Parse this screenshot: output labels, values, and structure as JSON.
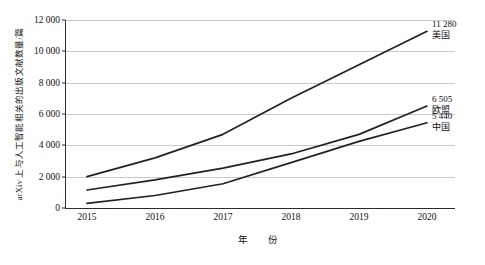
{
  "chart_data": {
    "type": "line",
    "title": "",
    "xlabel": "年　份",
    "ylabel": "arXiv 上与人工智能相关的出版文献数量/篇",
    "categories": [
      "2015",
      "2016",
      "2017",
      "2018",
      "2019",
      "2020"
    ],
    "x": [
      2015,
      2016,
      2017,
      2018,
      2019,
      2020
    ],
    "xlim": [
      2015,
      2020
    ],
    "ylim": [
      0,
      12000
    ],
    "yticks": [
      0,
      2000,
      4000,
      6000,
      8000,
      10000,
      12000
    ],
    "ytick_labels": [
      "0",
      "2 000",
      "4 000",
      "6 000",
      "8 000",
      "10 000",
      "12 000"
    ],
    "grid": true,
    "legend_position": "inline-end-labels",
    "series": [
      {
        "name": "美国",
        "values": [
          2000,
          3200,
          4700,
          7000,
          9150,
          11280
        ],
        "end_value_label": "11 280",
        "color": "#222222"
      },
      {
        "name": "欧盟",
        "values": [
          1150,
          1800,
          2550,
          3450,
          4700,
          6505
        ],
        "end_value_label": "6 505",
        "color": "#222222"
      },
      {
        "name": "中国",
        "values": [
          300,
          800,
          1550,
          2900,
          4250,
          5440
        ],
        "end_value_label": "5 440",
        "color": "#222222"
      }
    ],
    "annotations": [
      {
        "value": "11 280",
        "name": "美国"
      },
      {
        "value": "6 505",
        "name": "欧盟"
      },
      {
        "value": "5 440",
        "name": "中国"
      }
    ]
  }
}
